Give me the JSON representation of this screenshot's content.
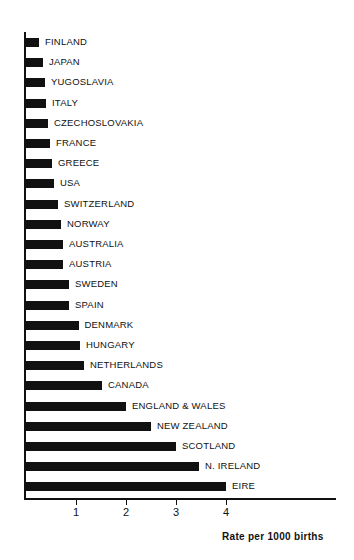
{
  "chart_data": {
    "type": "bar",
    "orientation": "horizontal",
    "title": "",
    "subtitle": "",
    "xlabel": "Rate per 1000 births",
    "ylabel": "",
    "xlim": [
      0,
      4.6
    ],
    "xticks": [
      1,
      2,
      3,
      4
    ],
    "xtick_labels": [
      "1",
      "2",
      "3",
      "4"
    ],
    "grid": false,
    "legend": null,
    "bar_color": "#111111",
    "background_color": "#ffffff",
    "categories": [
      "FINLAND",
      "JAPAN",
      "YUGOSLAVIA",
      "ITALY",
      "CZECHOSLOVAKIA",
      "FRANCE",
      "GREECE",
      "USA",
      "SWITZERLAND",
      "NORWAY",
      "AUSTRALIA",
      "AUSTRIA",
      "SWEDEN",
      "SPAIN",
      "DENMARK",
      "HUNGARY",
      "NETHERLANDS",
      "CANADA",
      "ENGLAND & WALES",
      "NEW ZEALAND",
      "SCOTLAND",
      "N. IRELAND",
      "EIRE"
    ],
    "values": [
      0.26,
      0.34,
      0.38,
      0.4,
      0.44,
      0.48,
      0.52,
      0.56,
      0.64,
      0.7,
      0.74,
      0.74,
      0.86,
      0.86,
      1.05,
      1.08,
      1.16,
      1.52,
      2.0,
      2.5,
      3.0,
      3.46,
      4.0
    ]
  }
}
